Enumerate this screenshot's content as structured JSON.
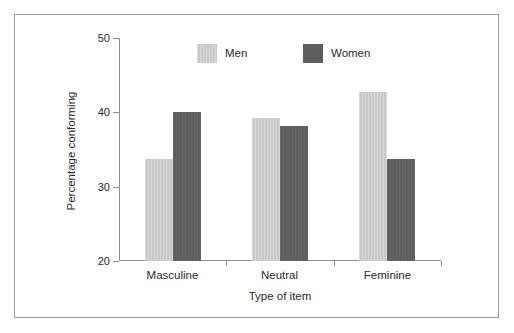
{
  "chart_data": {
    "type": "bar",
    "title": "",
    "subtitle": "",
    "xlabel": "Type of item",
    "ylabel": "Percentage conforming",
    "categories": [
      "Masculine",
      "Neutral",
      "Feminine"
    ],
    "series": [
      {
        "name": "Men",
        "color": "#c9c9c9",
        "values": [
          33.7,
          39.2,
          42.7
        ]
      },
      {
        "name": "Women",
        "color": "#5e5e5e",
        "values": [
          40.0,
          38.2,
          33.7
        ]
      }
    ],
    "ylim": [
      20,
      50
    ],
    "ytick_labels": [
      "50",
      "40",
      "30",
      "20"
    ],
    "ytick_values": [
      50,
      40,
      30,
      20
    ],
    "grid": false,
    "legend_position": "top-center",
    "axis_color": "#8d8d8d",
    "text_color": "#2b2b2b",
    "frame_color": "#9a9a9a",
    "background": "#ffffff"
  },
  "legend": {
    "items": [
      {
        "label": "Men",
        "swatch": "light-gray-swatch"
      },
      {
        "label": "Women",
        "swatch": "dark-gray-swatch"
      }
    ]
  },
  "axes": {
    "y_title": "Percentage conforming",
    "x_title": "Type of item",
    "y_ticks": [
      {
        "label": "50",
        "value": 50
      },
      {
        "label": "40",
        "value": 40
      },
      {
        "label": "30",
        "value": 30
      },
      {
        "label": "20",
        "value": 20
      }
    ],
    "x_ticks": [
      {
        "label": "Masculine"
      },
      {
        "label": "Neutral"
      },
      {
        "label": "Feminine"
      }
    ]
  }
}
